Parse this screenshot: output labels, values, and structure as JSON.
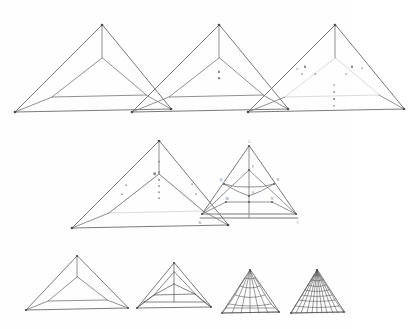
{
  "figure": {
    "background_color": "#fefefe",
    "line_color": "#6b6b6b",
    "faint_line_color": "#d2d2d2",
    "node_color": "#4a4a4a",
    "label_color": "#6f6f6f",
    "rows": 3,
    "panel_count": 9
  },
  "panels": [
    {
      "id": "panel-1",
      "name": "triangle-with-inner-triangle",
      "row": 1,
      "position": 1,
      "caption": "",
      "outer_triangle": {
        "apex": [
          97,
          13
        ],
        "left": [
          10,
          100
        ],
        "right": [
          166,
          97
        ]
      },
      "inner_triangle": {
        "apex": [
          97,
          46
        ],
        "left": [
          47,
          85
        ],
        "right": [
          141,
          83
        ]
      },
      "markers": [],
      "labels": []
    },
    {
      "id": "panel-2",
      "name": "triangle-with-centroid-marks",
      "row": 1,
      "position": 2,
      "caption": "",
      "outer_triangle": {
        "apex": [
          97,
          13
        ],
        "left": [
          10,
          100
        ],
        "right": [
          166,
          97
        ]
      },
      "inner_triangle": {
        "apex": [
          97,
          46
        ],
        "left": [
          47,
          85
        ],
        "right": [
          141,
          83
        ]
      },
      "markers": [
        {
          "x": 97,
          "y": 60,
          "size": 1.4
        },
        {
          "x": 97,
          "y": 66,
          "size": 1.4
        }
      ],
      "labels": []
    },
    {
      "id": "panel-3",
      "name": "triangle-with-scattered-node-marks",
      "row": 1,
      "position": 3,
      "caption": "",
      "outer_triangle": {
        "apex": [
          97,
          13
        ],
        "left": [
          10,
          100
        ],
        "right": [
          166,
          97
        ]
      },
      "inner_triangle": {
        "apex": [
          97,
          46
        ],
        "left": [
          47,
          85
        ],
        "right": [
          141,
          83
        ]
      },
      "markers": [
        {
          "x": 59,
          "y": 57,
          "size": 1.0
        },
        {
          "x": 67,
          "y": 55,
          "size": 1.3
        },
        {
          "x": 64,
          "y": 62,
          "size": 1.0
        },
        {
          "x": 77,
          "y": 62,
          "size": 1.0
        },
        {
          "x": 114,
          "y": 55,
          "size": 1.3
        },
        {
          "x": 124,
          "y": 56,
          "size": 1.0
        },
        {
          "x": 108,
          "y": 62,
          "size": 1.0
        },
        {
          "x": 96,
          "y": 73,
          "size": 1.0
        },
        {
          "x": 96,
          "y": 80,
          "size": 1.1
        },
        {
          "x": 96,
          "y": 87,
          "size": 1.2
        },
        {
          "x": 96,
          "y": 93,
          "size": 1.0
        }
      ],
      "labels": []
    },
    {
      "id": "panel-4",
      "name": "triangle-with-interior-annotation-cluster",
      "row": 2,
      "position": 1,
      "caption": "",
      "outer_triangle": {
        "apex": [
          97,
          13
        ],
        "left": [
          10,
          100
        ],
        "right": [
          166,
          97
        ]
      },
      "inner_triangle": {
        "apex": [
          97,
          46
        ],
        "left": [
          47,
          85
        ],
        "right": [
          141,
          83
        ]
      },
      "markers": [
        {
          "x": 97,
          "y": 34,
          "size": 1.1
        },
        {
          "x": 93,
          "y": 46,
          "size": 1.6
        },
        {
          "x": 97,
          "y": 44,
          "size": 1.2
        },
        {
          "x": 97,
          "y": 52,
          "size": 1.2
        },
        {
          "x": 97,
          "y": 58,
          "size": 1.1
        },
        {
          "x": 97,
          "y": 64,
          "size": 1.1
        },
        {
          "x": 97,
          "y": 70,
          "size": 1.1
        },
        {
          "x": 64,
          "y": 57,
          "size": 1.0
        },
        {
          "x": 60,
          "y": 66,
          "size": 1.0
        },
        {
          "x": 130,
          "y": 56,
          "size": 1.0
        },
        {
          "x": 134,
          "y": 66,
          "size": 1.0
        }
      ],
      "labels": []
    },
    {
      "id": "panel-5",
      "name": "labeled-triangle-construction",
      "row": 2,
      "position": 2,
      "caption": "",
      "outer_triangle": {
        "apex": [
          53,
          6
        ],
        "left": [
          6,
          74
        ],
        "right": [
          100,
          74
        ]
      },
      "vertex_labels": [
        {
          "text": "A",
          "x": 53,
          "y": 3,
          "anchor": "apex"
        },
        {
          "text": "B",
          "x": 4,
          "y": 80,
          "anchor": "bottom-left"
        },
        {
          "text": "C",
          "x": 102,
          "y": 80,
          "anchor": "bottom-right"
        },
        {
          "text": "P",
          "x": 56,
          "y": 28,
          "anchor": "interior-upper"
        },
        {
          "text": "Q",
          "x": 25,
          "y": 40,
          "anchor": "left-mid"
        },
        {
          "text": "R",
          "x": 81,
          "y": 40,
          "anchor": "right-mid"
        },
        {
          "text": "S",
          "x": 56,
          "y": 49,
          "anchor": "interior-lower"
        },
        {
          "text": "M",
          "x": 31,
          "y": 63,
          "anchor": "base-left"
        },
        {
          "text": "N",
          "x": 76,
          "y": 63,
          "anchor": "base-right"
        }
      ],
      "markers": []
    },
    {
      "id": "panel-6",
      "name": "mesh-level-0",
      "row": 3,
      "position": 1,
      "caption": "",
      "subdivision_level": 0,
      "outer_triangle": {
        "apex": [
          55,
          6
        ],
        "left": [
          4,
          60
        ],
        "right": [
          106,
          58
        ]
      },
      "inner_triangle": {
        "apex": [
          55,
          27
        ],
        "left": [
          26,
          51
        ],
        "right": [
          85,
          50
        ]
      }
    },
    {
      "id": "panel-7",
      "name": "mesh-level-1",
      "row": 3,
      "position": 2,
      "caption": "",
      "subdivision_level": 1,
      "outer_triangle": {
        "apex": [
          40,
          5
        ],
        "left": [
          3,
          45
        ],
        "right": [
          77,
          44
        ]
      },
      "inner_triangle": {
        "apex": [
          40,
          17
        ],
        "left": [
          19,
          38
        ],
        "right": [
          61,
          37
        ]
      }
    },
    {
      "id": "panel-8",
      "name": "mesh-level-2",
      "row": 3,
      "position": 3,
      "caption": "",
      "subdivision_level": 2,
      "outer_triangle": {
        "apex": [
          31,
          4
        ],
        "left": [
          3,
          47
        ],
        "right": [
          60,
          46
        ]
      },
      "grid_divisions": 5
    },
    {
      "id": "panel-9",
      "name": "mesh-level-3",
      "row": 3,
      "position": 4,
      "caption": "",
      "subdivision_level": 3,
      "outer_triangle": {
        "apex": [
          29,
          4
        ],
        "left": [
          3,
          47
        ],
        "right": [
          56,
          46
        ]
      },
      "grid_divisions": 9
    }
  ]
}
